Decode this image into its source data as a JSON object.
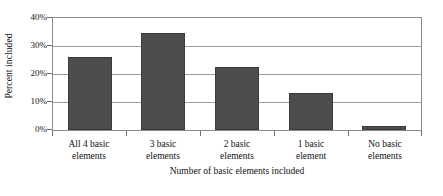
{
  "chart_data": {
    "type": "bar",
    "title": "",
    "subtitle": "",
    "xlabel": "Number of basic elements included",
    "ylabel": "Percent included",
    "categories": [
      "All 4 basic elements",
      "3 basic elements",
      "2 basic elements",
      "1 basic element",
      "No basic elements"
    ],
    "category_lines": [
      [
        "All 4 basic",
        "elements"
      ],
      [
        "3 basic",
        "elements"
      ],
      [
        "2 basic",
        "elements"
      ],
      [
        "1 basic",
        "element"
      ],
      [
        "No basic",
        "elements"
      ]
    ],
    "values": [
      26,
      34.5,
      22.5,
      13.2,
      1.5
    ],
    "value_labels": [
      "26%",
      "34.5%",
      "22.5%",
      "13.2%",
      "1.5%"
    ],
    "ylim": [
      0,
      40
    ],
    "xlim": [
      0,
      5
    ],
    "ytick_values": [
      0,
      10,
      20,
      30,
      40
    ],
    "ytick_labels": [
      "0%",
      "10%",
      "20%",
      "30%",
      "40%"
    ],
    "grid": true,
    "grid_axis": "y",
    "legend": false,
    "legend_position": "none",
    "bar_color": "#4d4d4d",
    "bar_edge_color": "#3a3a3a",
    "grid_color": "#9a9a9a",
    "axis_color": "#8c8c8c",
    "background_color": "#ffffff",
    "text_color": "#111111"
  }
}
